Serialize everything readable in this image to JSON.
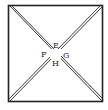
{
  "diagram": {
    "type": "square-with-double-diagonals",
    "square": {
      "x1": 8,
      "y1": 5,
      "x2": 103,
      "y2": 102
    },
    "labels": {
      "top": "E",
      "left": "F",
      "right": "G",
      "bottom": "H"
    },
    "stroke_color": "#222222"
  }
}
